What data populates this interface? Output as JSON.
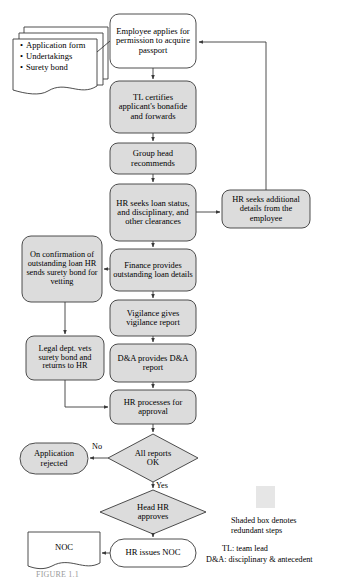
{
  "diagram": {
    "colors": {
      "shaded_fill": "#dcdcdc",
      "plain_fill": "#ffffff",
      "stroke": "#3a3a3a",
      "text": "#000000",
      "legend_swatch": "#e6e6e6"
    },
    "documents_stack": {
      "name": "input-documents",
      "items": [
        "Application form",
        "Undertakings",
        "Surety bond"
      ]
    },
    "nodes": [
      {
        "id": "employee_applies",
        "label": "Employee applies for permission to acquire passport",
        "shape": "rounded-box",
        "shaded": false,
        "x": 110,
        "y": 14,
        "w": 86,
        "h": 54
      },
      {
        "id": "tl_certifies",
        "label": "TL certifies applicant's bonafide and forwards",
        "shape": "rounded-box",
        "shaded": true,
        "x": 110,
        "y": 81,
        "w": 86,
        "h": 52
      },
      {
        "id": "group_head",
        "label": "Group head recommends",
        "shape": "rounded-box",
        "shaded": true,
        "x": 110,
        "y": 143,
        "w": 86,
        "h": 31
      },
      {
        "id": "hr_seeks_loan",
        "label": "HR seeks loan status, and disciplinary, and other clearances",
        "shape": "rounded-box",
        "shaded": true,
        "x": 110,
        "y": 184,
        "w": 86,
        "h": 57
      },
      {
        "id": "hr_additional",
        "label": "HR seeks additional details from the employee",
        "shape": "rounded-box",
        "shaded": true,
        "x": 222,
        "y": 190,
        "w": 88,
        "h": 38
      },
      {
        "id": "finance_loan",
        "label": "Finance provides outstanding loan details",
        "shape": "rounded-box",
        "shaded": true,
        "x": 110,
        "y": 249,
        "w": 86,
        "h": 42
      },
      {
        "id": "on_confirmation",
        "label": "On confirmation of outstanding loan HR sends surety bond for vetting",
        "shape": "rounded-box",
        "shaded": true,
        "x": 22,
        "y": 236,
        "w": 80,
        "h": 66
      },
      {
        "id": "vigilance",
        "label": "Vigilance gives vigilance report",
        "shape": "rounded-box",
        "shaded": true,
        "x": 110,
        "y": 300,
        "w": 86,
        "h": 36
      },
      {
        "id": "legal_dept",
        "label": "Legal dept. vets surety bond and returns to HR",
        "shape": "rounded-box",
        "shaded": true,
        "x": 26,
        "y": 336,
        "w": 78,
        "h": 44
      },
      {
        "id": "da_provides",
        "label": "D&A provides D&A report",
        "shape": "rounded-box",
        "shaded": true,
        "x": 110,
        "y": 344,
        "w": 86,
        "h": 38
      },
      {
        "id": "hr_processes",
        "label": "HR processes for approval",
        "shape": "rounded-box",
        "shaded": true,
        "x": 110,
        "y": 390,
        "w": 86,
        "h": 34
      },
      {
        "id": "all_reports_ok",
        "label": "All reports OK",
        "shape": "diamond",
        "shaded": true,
        "x": 108,
        "y": 434,
        "w": 90,
        "h": 48
      },
      {
        "id": "application_rejected",
        "label": "Application rejected",
        "shape": "terminator",
        "shaded": true,
        "x": 20,
        "y": 443,
        "w": 68,
        "h": 31
      },
      {
        "id": "head_hr_approves",
        "label": "Head HR approves",
        "shape": "diamond",
        "shaded": true,
        "x": 100,
        "y": 490,
        "w": 106,
        "h": 44
      },
      {
        "id": "hr_issues_noc",
        "label": "HR issues NOC",
        "shape": "terminator",
        "shaded": false,
        "x": 110,
        "y": 539,
        "w": 86,
        "h": 28
      },
      {
        "id": "noc_document",
        "label": "NOC",
        "shape": "document",
        "shaded": false,
        "x": 28,
        "y": 532,
        "w": 72,
        "h": 36
      }
    ],
    "edge_labels": [
      {
        "id": "no_label",
        "text": "No",
        "x": 92,
        "y": 443
      },
      {
        "id": "yes_label",
        "text": "Yes",
        "x": 156,
        "y": 482
      }
    ],
    "legend": {
      "swatch_note_line1": "Shaded box denotes",
      "swatch_note_line2": "redundant steps",
      "abbreviations": [
        "TL: team lead",
        "D&A: disciplinary & antecedent"
      ]
    },
    "caption": "FIGURE 1.1"
  }
}
